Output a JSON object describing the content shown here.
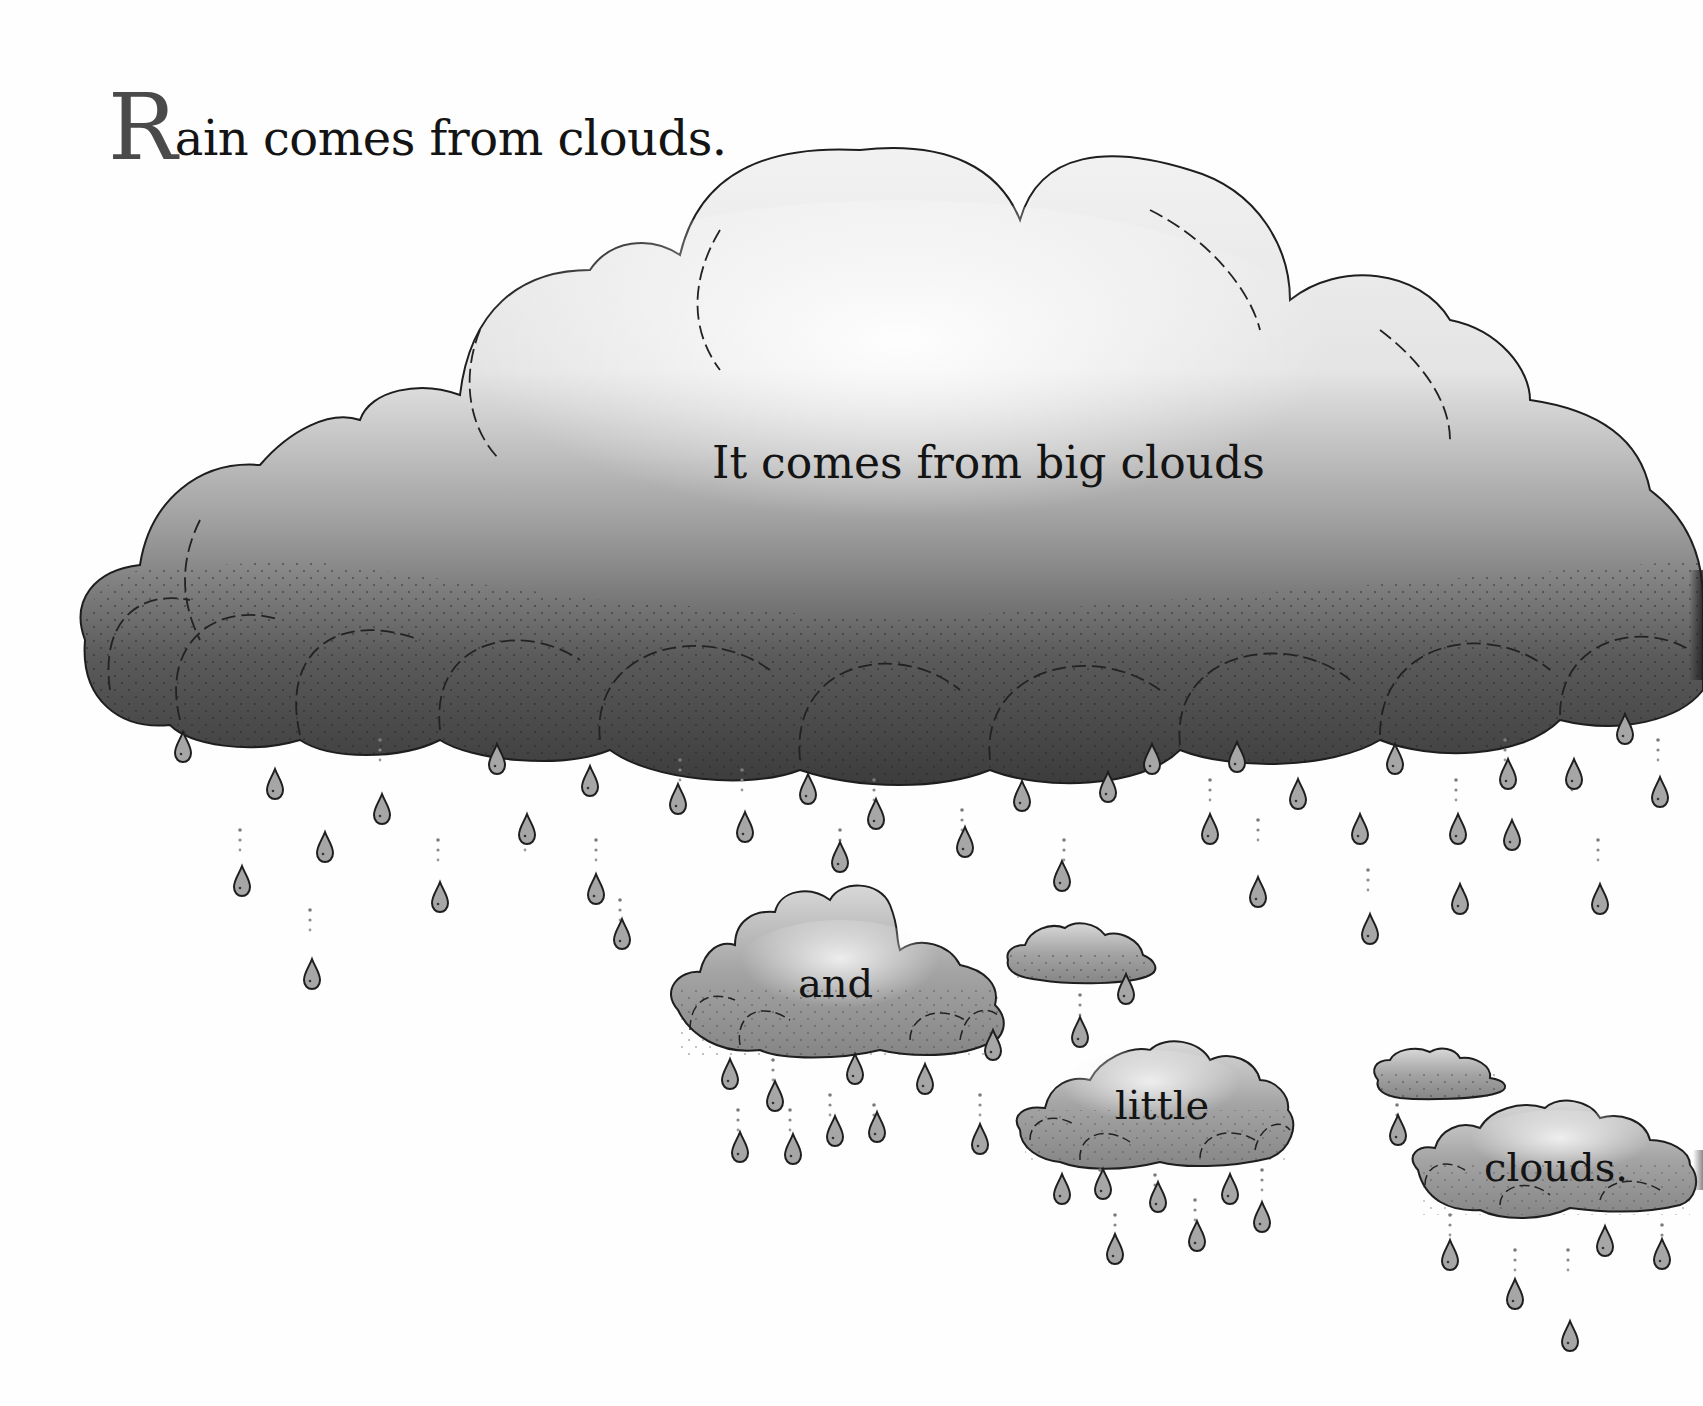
{
  "page": {
    "title": {
      "drop_cap": "R",
      "rest": "ain comes from clouds."
    },
    "captions": {
      "big": "It comes from big clouds",
      "and": "and",
      "little": "little",
      "clouds": "clouds."
    }
  },
  "illustration": {
    "style": "grayscale watercolor with ink outlines",
    "colors": {
      "cloud_light": "#e8e8e8",
      "cloud_mid": "#9a9a9a",
      "cloud_dark": "#4a4a4a",
      "ink": "#1e1e1e",
      "drop_fill": "#a8a8a8"
    },
    "clouds": [
      {
        "name": "big-cloud",
        "label": "It comes from big clouds"
      },
      {
        "name": "and-cloud",
        "label": "and"
      },
      {
        "name": "tiny-cloud-1",
        "label": ""
      },
      {
        "name": "little-cloud",
        "label": "little"
      },
      {
        "name": "tiny-cloud-2",
        "label": ""
      },
      {
        "name": "clouds-cloud",
        "label": "clouds."
      }
    ]
  }
}
